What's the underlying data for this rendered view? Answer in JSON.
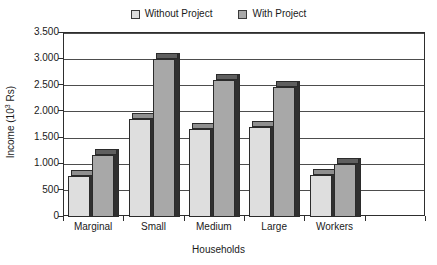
{
  "chart_data": {
    "type": "bar",
    "title": "",
    "xlabel": "Households",
    "ylabel": "Income (10³ Rs)",
    "ylabel_text": "Income (10",
    "ylabel_sup": "3",
    "ylabel_tail": " Rs)",
    "categories": [
      "Marginal",
      "Small",
      "Medium",
      "Large",
      "Workers"
    ],
    "series": [
      {
        "name": "Without Project",
        "color": "#dedede",
        "values": [
          780,
          1870,
          1680,
          1720,
          800
        ]
      },
      {
        "name": "With Project",
        "color": "#a8a8a8",
        "values": [
          1180,
          3000,
          2600,
          2480,
          1000
        ]
      }
    ],
    "ylim": [
      0,
      3500
    ],
    "ytick_values": [
      0,
      500,
      1000,
      1500,
      2000,
      2500,
      3000,
      3500
    ],
    "ytick_labels": [
      "0",
      "500",
      "1.000",
      "1.500",
      "2.000",
      "2.500",
      "3.000",
      "3.500"
    ],
    "grid": true,
    "legend_position": "top-center",
    "empty_slots": 1
  },
  "legend": {
    "entries": [
      {
        "label": "Without Project",
        "swatch": "#dedede"
      },
      {
        "label": "With Project",
        "swatch": "#a8a8a8"
      }
    ]
  },
  "axes": {
    "x_title": "Households",
    "y_title_main": "Income (10",
    "y_title_sup": "3",
    "y_title_tail": " Rs)"
  }
}
